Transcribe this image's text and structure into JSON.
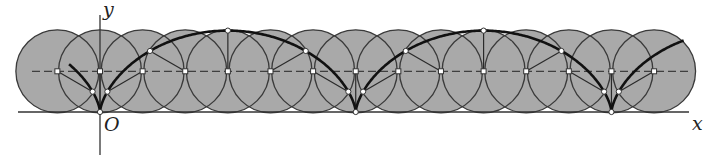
{
  "diagram": {
    "labels": {
      "y_axis": "y",
      "x_axis": "x",
      "origin": "O"
    },
    "colors": {
      "circle_fill": "#a9a9a9",
      "circle_stroke": "#3a3a3a",
      "cycloid": "#111111",
      "axis": "#333333",
      "dashed_line": "#3f3f3f",
      "radius_line": "#2a2a2a",
      "point_fill": "#ffffff",
      "point_stroke": "#333333"
    },
    "geometry": {
      "origin_px": [
        100,
        112
      ],
      "radius_px": 40.7,
      "circle_draw_radius_px": 41.5,
      "center_step_deg": 60,
      "circle_index_range": [
        -1,
        13
      ],
      "cycloid_t_range_rad": [
        -1.745,
        15.0
      ],
      "x_axis_px": [
        18,
        689
      ],
      "y_axis_px": [
        15,
        155
      ],
      "dashed_line_x_px": [
        32,
        690
      ]
    },
    "cusps_x_px": [
      100,
      355,
      611
    ],
    "arch_tops_x_px": [
      228,
      483
    ]
  }
}
